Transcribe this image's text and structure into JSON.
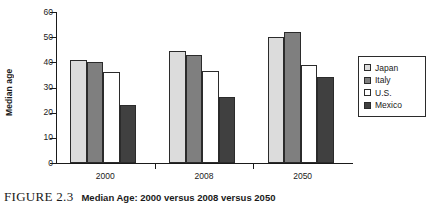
{
  "figure": {
    "number_label": "FIGURE 2.3",
    "caption_title": "Median Age: 2000 versus 2008 versus 2050"
  },
  "legend": {
    "position": "right",
    "items": [
      {
        "label": "Japan",
        "color": "#dcdcdc"
      },
      {
        "label": "Italy",
        "color": "#7f7f7f"
      },
      {
        "label": "U.S.",
        "color": "#ffffff"
      },
      {
        "label": "Mexico",
        "color": "#404040"
      }
    ]
  },
  "chart_data": {
    "type": "bar",
    "title": "",
    "xlabel": "",
    "ylabel": "Median age",
    "categories": [
      "2000",
      "2008",
      "2050"
    ],
    "series": [
      {
        "name": "Japan",
        "color": "#dcdcdc",
        "values": [
          41,
          44.5,
          50
        ]
      },
      {
        "name": "Italy",
        "color": "#7f7f7f",
        "values": [
          40,
          43,
          52
        ]
      },
      {
        "name": "U.S.",
        "color": "#ffffff",
        "values": [
          36,
          36.7,
          39
        ]
      },
      {
        "name": "Mexico",
        "color": "#404040",
        "values": [
          23,
          26.4,
          34
        ]
      }
    ],
    "ylim": [
      0,
      60
    ],
    "yticks": [
      0,
      10,
      20,
      30,
      40,
      50,
      60
    ],
    "ytick_labels": [
      "0",
      "10",
      "20",
      "30",
      "40",
      "50",
      "60"
    ],
    "grid": false
  }
}
